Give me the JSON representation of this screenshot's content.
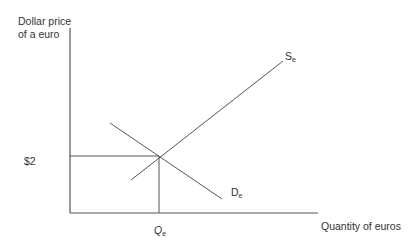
{
  "diagram": {
    "type": "supply-demand",
    "y_axis_label_line1": "Dollar price",
    "y_axis_label_line2": "of a euro",
    "x_axis_label": "Quantity of euros",
    "price_label": "$2",
    "quantity_label": "Q",
    "quantity_sub": "e",
    "supply_label": "S",
    "supply_sub": "e",
    "demand_label": "D",
    "demand_sub": "e",
    "line_color": "#555555"
  }
}
